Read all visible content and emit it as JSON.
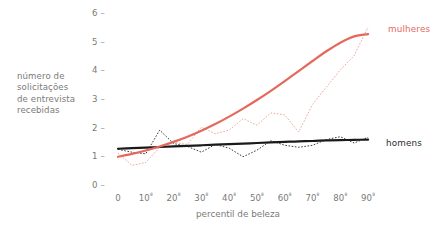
{
  "axes": {
    "y_title_lines": [
      "número de",
      "solicitações",
      "de entrevista",
      "recebidas"
    ],
    "y_ticks": [
      "6",
      "5",
      "4",
      "3",
      "2",
      "1",
      "0"
    ],
    "tick_dash": "–",
    "x_title": "percentil de beleza",
    "x_ticks": [
      {
        "num": "0",
        "sup": ""
      },
      {
        "num": "10",
        "sup": "º"
      },
      {
        "num": "20",
        "sup": "º"
      },
      {
        "num": "30",
        "sup": "º"
      },
      {
        "num": "40",
        "sup": "º"
      },
      {
        "num": "50",
        "sup": "º"
      },
      {
        "num": "60",
        "sup": "º"
      },
      {
        "num": "70",
        "sup": "º"
      },
      {
        "num": "80",
        "sup": "º"
      },
      {
        "num": "90",
        "sup": "º"
      }
    ]
  },
  "legend": {
    "women_label": "mulheres",
    "men_label": "homens"
  },
  "colors": {
    "women": "#e4695c",
    "women_raw": "#eea79d",
    "men": "#1a1a1a",
    "men_raw": "#3a3a3a",
    "text": "#7a7a7a",
    "background": "#ffffff"
  },
  "chart_data": {
    "type": "line",
    "title": "",
    "xlabel": "percentil de beleza",
    "ylabel": "número de solicitações de entrevista recebidas",
    "xlim": [
      0,
      95
    ],
    "ylim": [
      0,
      6
    ],
    "grid": false,
    "legend_position": "right-inline",
    "x_tick_values": [
      0,
      10,
      20,
      30,
      40,
      50,
      60,
      70,
      80,
      90
    ],
    "y_tick_values": [
      0,
      1,
      2,
      3,
      4,
      5,
      6
    ],
    "x": [
      0,
      5,
      10,
      15,
      20,
      25,
      30,
      35,
      40,
      45,
      50,
      55,
      60,
      65,
      70,
      75,
      80,
      85,
      90
    ],
    "series": [
      {
        "name": "mulheres",
        "style": "dotted-raw",
        "color": "#eea79d",
        "values": [
          1.15,
          0.72,
          0.82,
          1.35,
          1.52,
          1.45,
          2.05,
          1.82,
          1.95,
          2.35,
          2.12,
          2.55,
          2.48,
          1.88,
          2.85,
          3.45,
          4.05,
          4.55,
          5.55
        ]
      },
      {
        "name": "mulheres (tendência)",
        "style": "smooth-fit",
        "color": "#e4695c",
        "values": [
          1.02,
          1.12,
          1.24,
          1.38,
          1.54,
          1.72,
          1.93,
          2.16,
          2.42,
          2.7,
          3.0,
          3.32,
          3.66,
          4.01,
          4.36,
          4.7,
          5.0,
          5.22,
          5.3
        ]
      },
      {
        "name": "homens",
        "style": "dotted-raw",
        "color": "#3a3a3a",
        "values": [
          1.28,
          1.18,
          1.12,
          1.95,
          1.48,
          1.38,
          1.18,
          1.45,
          1.32,
          1.02,
          1.25,
          1.58,
          1.42,
          1.35,
          1.42,
          1.62,
          1.72,
          1.5,
          1.7
        ]
      },
      {
        "name": "homens (tendência)",
        "style": "smooth-fit",
        "color": "#1a1a1a",
        "values": [
          1.3,
          1.32,
          1.34,
          1.36,
          1.38,
          1.4,
          1.42,
          1.44,
          1.46,
          1.48,
          1.5,
          1.52,
          1.54,
          1.56,
          1.57,
          1.59,
          1.6,
          1.61,
          1.62
        ]
      }
    ]
  }
}
